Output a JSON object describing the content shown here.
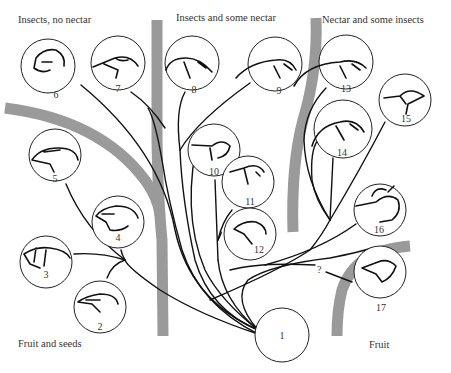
{
  "labels": {
    "top_left": "Insects, no nectar",
    "top_center": "Insects and some nectar",
    "top_right": "Nectar and some insects",
    "bottom_left": "Fruit and seeds",
    "bottom_right": "Fruit"
  },
  "nodes": [
    {
      "id": "1",
      "label": "1",
      "icon": "ancestor-circle"
    },
    {
      "id": "2",
      "label": "2",
      "icon": "finch-head-icon"
    },
    {
      "id": "3",
      "label": "3",
      "icon": "finch-head-icon"
    },
    {
      "id": "4",
      "label": "4",
      "icon": "finch-head-icon"
    },
    {
      "id": "5",
      "label": "5",
      "icon": "finch-head-icon"
    },
    {
      "id": "6",
      "label": "6",
      "icon": "finch-head-icon"
    },
    {
      "id": "7",
      "label": "7",
      "icon": "finch-head-icon"
    },
    {
      "id": "8",
      "label": "8",
      "icon": "curved-beak-bird-head-icon"
    },
    {
      "id": "9",
      "label": "9",
      "icon": "curved-beak-bird-head-icon"
    },
    {
      "id": "10",
      "label": "10",
      "icon": "thin-beak-bird-head-icon"
    },
    {
      "id": "11",
      "label": "11",
      "icon": "thin-beak-bird-head-icon"
    },
    {
      "id": "12",
      "label": "12",
      "icon": "thin-beak-bird-head-icon"
    },
    {
      "id": "13",
      "label": "13",
      "icon": "curved-beak-bird-head-icon"
    },
    {
      "id": "14",
      "label": "14",
      "icon": "curved-beak-bird-head-icon"
    },
    {
      "id": "15",
      "label": "15",
      "icon": "thin-beak-bird-head-icon"
    },
    {
      "id": "16",
      "label": "16",
      "icon": "crested-bird-head-icon"
    },
    {
      "id": "17",
      "label": "17",
      "icon": "stout-bird-head-icon"
    }
  ],
  "uncertain_link": {
    "label": "?",
    "from": "1",
    "to": "17"
  }
}
